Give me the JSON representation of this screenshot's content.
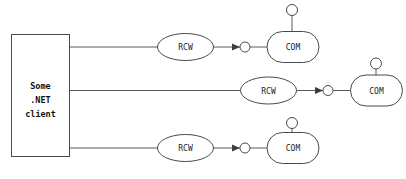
{
  "diagram": {
    "background_color": "#ffffff",
    "stroke_color": "#4a4a4a",
    "text_color": "#1c1c1c",
    "client": {
      "name": "dotnet-client-box",
      "lines": [
        "Some",
        ".NET",
        "client"
      ],
      "line1": "Some",
      "line2": ".NET",
      "line3": "client"
    },
    "rows": [
      {
        "id": "row-top",
        "rcw_label": "RCW",
        "com_label": "COM",
        "socket_icon": "socket-circle-icon",
        "arrow_icon": "arrowhead-right-icon",
        "lollipop_icon": "provided-interface-lollipop-icon"
      },
      {
        "id": "row-middle",
        "rcw_label": "RCW",
        "com_label": "COM",
        "socket_icon": "socket-circle-icon",
        "arrow_icon": "arrowhead-right-icon",
        "lollipop_icon": "provided-interface-lollipop-icon"
      },
      {
        "id": "row-bottom",
        "rcw_label": "RCW",
        "com_label": "COM",
        "socket_icon": "socket-circle-icon",
        "arrow_icon": "arrowhead-right-icon",
        "lollipop_icon": "provided-interface-lollipop-icon"
      }
    ]
  }
}
